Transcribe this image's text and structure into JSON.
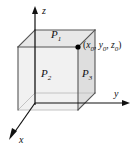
{
  "figure": {
    "background_color": "#ffffff",
    "width": 136,
    "height": 149
  },
  "axes": {
    "z": {
      "label": "z",
      "direction": "up"
    },
    "y": {
      "label": "y",
      "direction": "right"
    },
    "x": {
      "label": "x",
      "direction": "down-left"
    },
    "line_color": "#111111",
    "origin": {
      "x": 35,
      "y": 103
    }
  },
  "box": {
    "fill_front": "#f0f0f0",
    "fill_top": "#e6e6e6",
    "fill_right": "#dcdcdc",
    "edge_color": "#4d4d4d",
    "hidden_edge_color": "#b4b4b4",
    "faces": [
      {
        "name": "top-face",
        "label": "P",
        "subscript": "1"
      },
      {
        "name": "front-face",
        "label": "P",
        "subscript": "2"
      },
      {
        "name": "right-face",
        "label": "P",
        "subscript": "3"
      }
    ]
  },
  "point": {
    "name": "corner-point",
    "marker_color": "#000000",
    "open_paren": "(",
    "close_paren": ")",
    "comma": ", ",
    "coords": [
      {
        "var": "x",
        "sub": "0"
      },
      {
        "var": "y",
        "sub": "0"
      },
      {
        "var": "z",
        "sub": "0"
      }
    ]
  }
}
